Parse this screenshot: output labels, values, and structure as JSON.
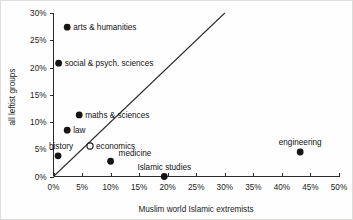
{
  "chart_data": {
    "type": "scatter",
    "title": "",
    "xlabel": "Muslim world Islamic extremists",
    "ylabel": "all leftist groups",
    "xlim": [
      0,
      50
    ],
    "ylim": [
      0,
      30
    ],
    "grid": false,
    "legend": "none",
    "x_ticks": [
      "0%",
      "5%",
      "10%",
      "15%",
      "20%",
      "25%",
      "30%",
      "35%",
      "40%",
      "45%",
      "50%"
    ],
    "x_tick_values": [
      0,
      5,
      10,
      15,
      20,
      25,
      30,
      35,
      40,
      45,
      50
    ],
    "y_ticks": [
      "0%",
      "5%",
      "10%",
      "15%",
      "20%",
      "25%",
      "30%"
    ],
    "y_tick_values": [
      0,
      5,
      10,
      15,
      20,
      25,
      30
    ],
    "points": [
      {
        "label": "arts & humanities",
        "x": 2.4,
        "y": 27.4,
        "marker": "filled",
        "label_pos": "right"
      },
      {
        "label": "social & psych. sciences",
        "x": 0.9,
        "y": 20.8,
        "marker": "filled",
        "label_pos": "right"
      },
      {
        "label": "maths & sciences",
        "x": 4.5,
        "y": 11.3,
        "marker": "filled",
        "label_pos": "right"
      },
      {
        "label": "law",
        "x": 2.4,
        "y": 8.5,
        "marker": "filled",
        "label_pos": "right"
      },
      {
        "label": "economics",
        "x": 6.4,
        "y": 5.6,
        "marker": "open",
        "label_pos": "right"
      },
      {
        "label": "history",
        "x": 0.8,
        "y": 3.8,
        "marker": "filled",
        "label_pos": "above-left"
      },
      {
        "label": "medicine",
        "x": 10.0,
        "y": 2.8,
        "marker": "filled",
        "label_pos": "above-right"
      },
      {
        "label": "Islamic studies",
        "x": 19.4,
        "y": 0.0,
        "marker": "filled",
        "label_pos": "above"
      },
      {
        "label": "engineering",
        "x": 43.2,
        "y": 4.5,
        "marker": "filled",
        "label_pos": "above"
      }
    ],
    "reference_line": {
      "description": "y = x diagonal reference line",
      "from": [
        0,
        0
      ],
      "to": [
        30,
        30
      ]
    },
    "colors": {
      "marker": "#151515",
      "axis": "#2a2a2a",
      "reference_line": "#2b2b2b",
      "background": "#fefefe",
      "text": "#121212"
    }
  }
}
